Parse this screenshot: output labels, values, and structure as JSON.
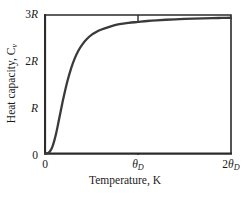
{
  "chart_data": {
    "type": "line",
    "title": "",
    "xlabel": "Temperature, K",
    "ylabel": "Heat capacity, C",
    "ylabel_sub": "v",
    "xlim": [
      0,
      2
    ],
    "ylim": [
      0,
      3
    ],
    "grid": false,
    "legend": "none",
    "xticks": [
      {
        "value": 0,
        "label_num": "0",
        "label_sym": "",
        "label_sub": ""
      },
      {
        "value": 1,
        "label_num": "",
        "label_sym": "θ",
        "label_sub": "D"
      },
      {
        "value": 2,
        "label_num": "2",
        "label_sym": "θ",
        "label_sub": "D"
      }
    ],
    "yticks": [
      {
        "value": 0,
        "label_num": "0",
        "label_sym": ""
      },
      {
        "value": 1,
        "label_num": "",
        "label_sym": "R"
      },
      {
        "value": 2,
        "label_num": "2",
        "label_sym": "R"
      },
      {
        "value": 3,
        "label_num": "3",
        "label_sym": "R"
      }
    ],
    "series": [
      {
        "name": "Debye heat capacity",
        "color": "#3a3a3a",
        "x": [
          0.0,
          0.02,
          0.04,
          0.06,
          0.08,
          0.1,
          0.12,
          0.14,
          0.16,
          0.18,
          0.2,
          0.24,
          0.28,
          0.32,
          0.36,
          0.4,
          0.45,
          0.5,
          0.55,
          0.6,
          0.7,
          0.8,
          0.9,
          1.0,
          1.1,
          1.2,
          1.3,
          1.4,
          1.5,
          1.6,
          1.7,
          1.8,
          1.9,
          2.0
        ],
        "y": [
          0.0,
          0.003,
          0.02,
          0.07,
          0.15,
          0.28,
          0.44,
          0.63,
          0.83,
          1.03,
          1.22,
          1.56,
          1.84,
          2.06,
          2.23,
          2.36,
          2.48,
          2.57,
          2.63,
          2.68,
          2.75,
          2.8,
          2.83,
          2.85,
          2.87,
          2.885,
          2.897,
          2.906,
          2.914,
          2.921,
          2.927,
          2.932,
          2.936,
          2.94
        ]
      }
    ]
  },
  "axes": {
    "curve_color": "#3a3a3a",
    "frame_color": "#2b2b2b",
    "background": "#ffffff"
  }
}
